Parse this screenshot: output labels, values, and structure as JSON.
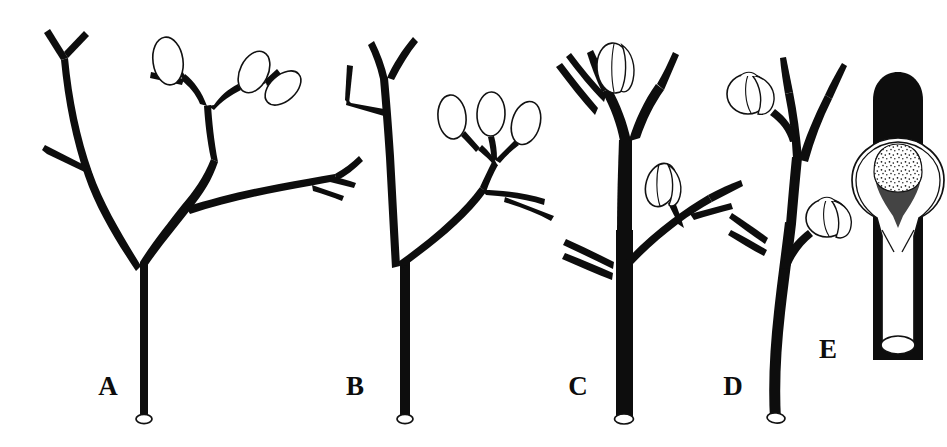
{
  "figure": {
    "kind": "botanical-line-drawing",
    "background_color": "#ffffff",
    "ink_color": "#0d0d0d",
    "stipple_color": "#1a1a1a",
    "panel_count": 5,
    "labels": [
      "A",
      "B",
      "C",
      "D",
      "E"
    ]
  },
  "panels": [
    {
      "label": "A",
      "label_x": 108,
      "label_y": 395,
      "description": "Dichotomously branched axis with three stalked ovoid sporangia on upper right branchlets and bare tapering branches at left",
      "sporangia_count": 3,
      "sporangium_shape": "elongate-ovoid",
      "branching": "dichotomous",
      "stem_base": "obliquely-truncate-open"
    },
    {
      "label": "B",
      "label_x": 355,
      "label_y": 395,
      "description": "Erect axis with a lateral branch system bearing three stalked elongate sporangia and a bare forked branch below",
      "sporangia_count": 3,
      "sporangium_shape": "elongate-ovoid",
      "branching": "dichotomous",
      "stem_base": "obliquely-truncate-open"
    },
    {
      "label": "C",
      "label_x": 578,
      "label_y": 395,
      "description": "Stout erect axis with two sessile bivalved sporangia seated in the forks of short lateral branches",
      "sporangia_count": 2,
      "sporangium_shape": "ovoid-bivalved",
      "branching": "dichotomous",
      "stem_base": "obliquely-truncate-open"
    },
    {
      "label": "D",
      "label_x": 733,
      "label_y": 395,
      "description": "Slender curved axis bearing two rounded bilobed sporangia on very short lateral stalks",
      "sporangia_count": 2,
      "sporangium_shape": "rounded-bilobed",
      "branching": "sparse-lateral",
      "stem_base": "obliquely-truncate-open"
    },
    {
      "label": "E",
      "label_x": 828,
      "label_y": 358,
      "description": "Enlarged detail of a single stippled sporangium attached to a thick stem, showing the V-shaped dehiscence line and rounded apex",
      "sporangia_count": 1,
      "sporangium_shape": "stippled-detail",
      "branching": "none",
      "stem_base": "truncate-open"
    }
  ]
}
